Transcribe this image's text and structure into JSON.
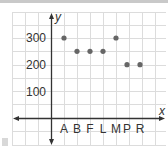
{
  "chart_data": {
    "type": "scatter",
    "title": "",
    "xlabel": "x",
    "ylabel": "y",
    "categories": [
      "A",
      "B",
      "F",
      "L",
      "M",
      "P",
      "R"
    ],
    "values": [
      300,
      250,
      250,
      250,
      300,
      200,
      200
    ],
    "y_ticks": [
      "100",
      "200",
      "300"
    ],
    "ylim": [
      0,
      350
    ],
    "grid": true,
    "legend": null,
    "point_color": "#666666"
  },
  "labels": {
    "x_axis": "x",
    "y_axis": "y",
    "tick_100": "100",
    "tick_200": "200",
    "tick_300": "300",
    "cat_0": "A",
    "cat_1": "B",
    "cat_2": "F",
    "cat_3": "L",
    "cat_4": "M",
    "cat_5": "P",
    "cat_6": "R"
  }
}
